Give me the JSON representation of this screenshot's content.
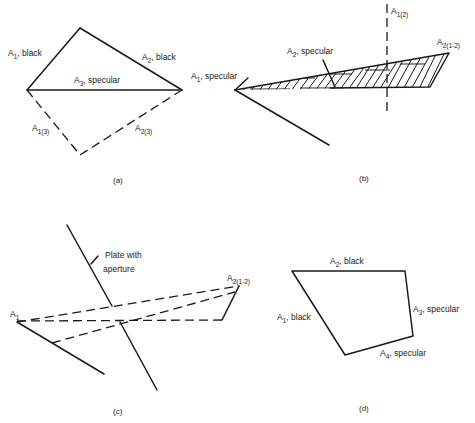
{
  "figure": {
    "panels": [
      {
        "id": "a",
        "caption": "(a)",
        "labels": {
          "a1": {
            "main": "A",
            "sub": "1",
            "rest": ", black"
          },
          "a2": {
            "main": "A",
            "sub": "2",
            "rest": ", black"
          },
          "a3": {
            "main": "A",
            "sub": "3",
            "rest": ", specular"
          },
          "a13": {
            "main": "A",
            "sub": "1(3)",
            "rest": ""
          },
          "a23": {
            "main": "A",
            "sub": "2(3)",
            "rest": ""
          }
        }
      },
      {
        "id": "b",
        "caption": "(b)",
        "labels": {
          "a1": {
            "main": "A",
            "sub": "1",
            "rest": ", specular"
          },
          "a2": {
            "main": "A",
            "sub": "2",
            "rest": ", specular"
          },
          "a12": {
            "main": "A",
            "sub": "1(2)",
            "rest": ""
          },
          "a212": {
            "main": "A",
            "sub": "2(1-2)",
            "rest": ""
          }
        }
      },
      {
        "id": "c",
        "caption": "(c)",
        "labels": {
          "plate_line1": "Plate with",
          "plate_line2": "aperture",
          "a1": {
            "main": "A",
            "sub": "1",
            "rest": ""
          },
          "a212": {
            "main": "A",
            "sub": "2(1-2)",
            "rest": ""
          }
        }
      },
      {
        "id": "d",
        "caption": "(d)",
        "labels": {
          "a1": {
            "main": "A",
            "sub": "1",
            "rest": ", black"
          },
          "a2": {
            "main": "A",
            "sub": "2",
            "rest": ", black"
          },
          "a3": {
            "main": "A",
            "sub": "3",
            "rest": ", specular"
          },
          "a4": {
            "main": "A",
            "sub": "4",
            "rest": ", specular"
          }
        }
      }
    ]
  }
}
